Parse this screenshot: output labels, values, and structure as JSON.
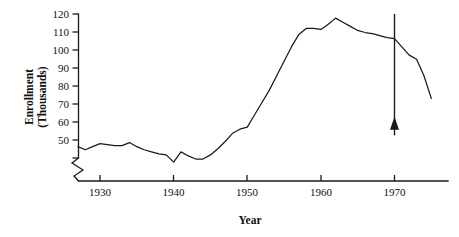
{
  "chart_data": {
    "type": "line",
    "title": "",
    "xlabel": "Year",
    "ylabel": "Enrollment (Thousands)",
    "ylabel_line1": "Enrollment",
    "ylabel_line2": "(Thousands)",
    "xlim": [
      1927,
      1975
    ],
    "ylim": [
      45,
      120
    ],
    "y_axis_break": true,
    "grid": false,
    "legend": null,
    "xticks": [
      1930,
      1940,
      1950,
      1960,
      1970
    ],
    "xtick_labels": [
      "1930",
      "1940",
      "1950",
      "1960",
      "1970"
    ],
    "yticks": [
      50,
      60,
      70,
      80,
      90,
      100,
      110,
      120
    ],
    "ytick_labels": [
      "50",
      "60",
      "70",
      "80",
      "90",
      "100",
      "110",
      "120"
    ],
    "series": [
      {
        "name": "Enrollment",
        "x": [
          1927,
          1928,
          1929,
          1930,
          1931,
          1932,
          1933,
          1934,
          1935,
          1936,
          1937,
          1938,
          1939,
          1940,
          1941,
          1942,
          1943,
          1944,
          1945,
          1946,
          1947,
          1948,
          1949,
          1950,
          1951,
          1952,
          1953,
          1954,
          1955,
          1956,
          1957,
          1958,
          1959,
          1960,
          1961,
          1962,
          1963,
          1964,
          1965,
          1966,
          1967,
          1968,
          1969,
          1970,
          1971,
          1972,
          1973,
          1974,
          1975
        ],
        "values": [
          55.5,
          54.0,
          55.5,
          57.0,
          56.5,
          56.0,
          56.0,
          57.5,
          55.5,
          54.0,
          53.0,
          52.0,
          51.5,
          48.0,
          53.0,
          51.0,
          49.5,
          49.5,
          51.5,
          54.5,
          58.0,
          62.0,
          64.0,
          65.0,
          71.0,
          77.0,
          83.0,
          90.0,
          97.0,
          104.0,
          110.0,
          113.0,
          113.0,
          112.5,
          115.0,
          118.0,
          116.0,
          114.0,
          112.0,
          111.0,
          110.5,
          109.5,
          108.5,
          108.0,
          104.0,
          100.0,
          98.0,
          90.0,
          79.0
        ]
      }
    ],
    "annotations": [
      {
        "type": "vertical-marker-with-arrow",
        "x": 1970,
        "label": "",
        "y_top": 120,
        "y_bottom": 61,
        "arrow_direction": "up"
      }
    ]
  }
}
